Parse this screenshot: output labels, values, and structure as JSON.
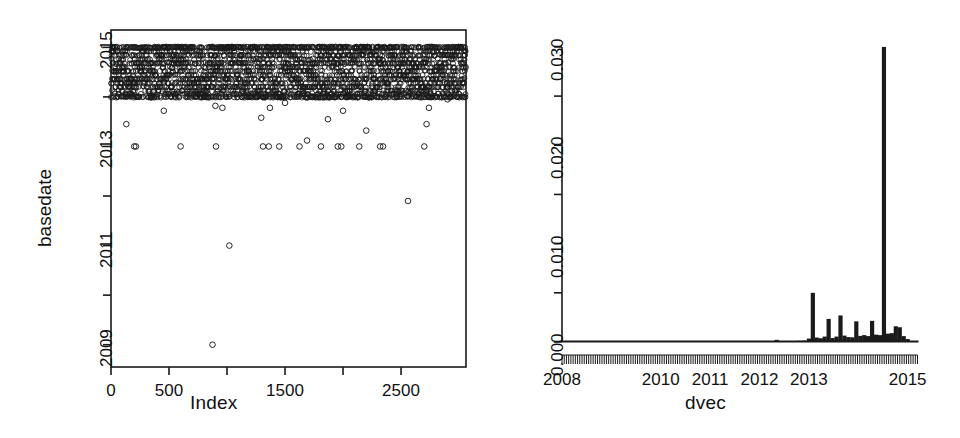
{
  "figure": {
    "background_color": "#ffffff",
    "ink_color": "#1a1a1a",
    "layout": "two-panel-row"
  },
  "chart_data": [
    {
      "id": "left-scatter",
      "type": "scatter",
      "title": "",
      "xlabel": "Index",
      "ylabel": "basedate",
      "xlim": [
        0,
        3060
      ],
      "ylim": [
        2008.55,
        2015.35
      ],
      "grid": false,
      "legend": null,
      "point_marker": "open-circle",
      "xticks": [
        0,
        500,
        1000,
        1500,
        2000,
        2500
      ],
      "xtick_labels": [
        "0",
        "500",
        "",
        "1500",
        "",
        "2500"
      ],
      "yticks": [
        2009,
        2010,
        2011,
        2012,
        2013,
        2014,
        2015
      ],
      "ytick_labels": [
        "2009",
        "",
        "2011",
        "",
        "2013",
        "",
        "2015"
      ],
      "description": "Dense band of points between 2014.0 and 2015.0 across all indices, plus scattered low outliers",
      "dense_band": {
        "y_min": 2014.0,
        "y_max": 2015.05,
        "n_points": 2900
      },
      "outliers": [
        {
          "x": 132,
          "y": 2013.45
        },
        {
          "x": 200,
          "y": 2013.0
        },
        {
          "x": 215,
          "y": 2013.0
        },
        {
          "x": 455,
          "y": 2013.72
        },
        {
          "x": 600,
          "y": 2013.0
        },
        {
          "x": 875,
          "y": 2009.0
        },
        {
          "x": 905,
          "y": 2013.0
        },
        {
          "x": 900,
          "y": 2013.82
        },
        {
          "x": 960,
          "y": 2013.78
        },
        {
          "x": 1020,
          "y": 2011.0
        },
        {
          "x": 1310,
          "y": 2013.0
        },
        {
          "x": 1360,
          "y": 2013.0
        },
        {
          "x": 1295,
          "y": 2013.58
        },
        {
          "x": 1370,
          "y": 2013.78
        },
        {
          "x": 1450,
          "y": 2013.0
        },
        {
          "x": 1500,
          "y": 2013.88
        },
        {
          "x": 1625,
          "y": 2013.0
        },
        {
          "x": 1690,
          "y": 2013.12
        },
        {
          "x": 1810,
          "y": 2013.0
        },
        {
          "x": 1870,
          "y": 2013.55
        },
        {
          "x": 1955,
          "y": 2013.0
        },
        {
          "x": 1985,
          "y": 2013.0
        },
        {
          "x": 2000,
          "y": 2013.72
        },
        {
          "x": 2140,
          "y": 2013.0
        },
        {
          "x": 2200,
          "y": 2013.32
        },
        {
          "x": 2320,
          "y": 2013.0
        },
        {
          "x": 2345,
          "y": 2013.0
        },
        {
          "x": 2560,
          "y": 2011.9
        },
        {
          "x": 2700,
          "y": 2013.0
        },
        {
          "x": 2720,
          "y": 2013.45
        },
        {
          "x": 2740,
          "y": 2013.78
        },
        {
          "x": 2900,
          "y": 2013.95
        }
      ]
    },
    {
      "id": "right-density",
      "type": "bar",
      "title": "",
      "xlabel": "dvec",
      "ylabel": "basedate",
      "xlim": [
        2008.0,
        2015.25
      ],
      "ylim": [
        0.0,
        0.0305
      ],
      "grid": false,
      "legend": null,
      "xticks": [
        2008,
        2009,
        2010,
        2011,
        2012,
        2013,
        2014,
        2015
      ],
      "xtick_labels": [
        "2008",
        "",
        "2010",
        "2011",
        "2012",
        "2013",
        "",
        "2015"
      ],
      "yticks": [
        0.0,
        0.005,
        0.01,
        0.015,
        0.02,
        0.025,
        0.03
      ],
      "ytick_labels": [
        "0.000",
        "",
        "0.010",
        "",
        "0.020",
        "",
        "0.030"
      ],
      "rug": true,
      "rug_note": "dense monthly tick rug below the axis spanning 2008 to 2015",
      "categories": [
        2008.05,
        2008.2,
        2008.4,
        2008.6,
        2008.8,
        2009.0,
        2009.2,
        2009.4,
        2009.6,
        2009.8,
        2010.0,
        2010.2,
        2010.4,
        2010.6,
        2010.8,
        2011.0,
        2011.2,
        2011.4,
        2011.6,
        2011.8,
        2012.0,
        2012.2,
        2012.35,
        2012.5,
        2012.65,
        2012.8,
        2012.9,
        2013.0,
        2013.08,
        2013.16,
        2013.24,
        2013.32,
        2013.4,
        2013.48,
        2013.56,
        2013.64,
        2013.72,
        2013.8,
        2013.88,
        2013.96,
        2014.04,
        2014.12,
        2014.2,
        2014.28,
        2014.36,
        2014.44,
        2014.52,
        2014.6,
        2014.68,
        2014.76,
        2014.84,
        2014.92,
        2015.0,
        2015.08,
        2015.16
      ],
      "values": [
        4e-05,
        4e-05,
        4e-05,
        4e-05,
        4e-05,
        4e-05,
        4e-05,
        4e-05,
        4e-05,
        4e-05,
        4e-05,
        4e-05,
        4e-05,
        4e-05,
        4e-05,
        4e-05,
        4e-05,
        4e-05,
        4e-05,
        4e-05,
        4e-05,
        4e-05,
        0.00022,
        6e-05,
        6e-05,
        0.00012,
        0.00014,
        0.00035,
        0.005,
        0.00045,
        0.00038,
        0.00055,
        0.00235,
        0.0004,
        0.00055,
        0.0027,
        0.00065,
        0.0005,
        0.00048,
        0.0021,
        0.00062,
        0.0007,
        0.0006,
        0.00215,
        0.00075,
        0.0007,
        0.03,
        0.00085,
        0.0009,
        0.0016,
        0.0015,
        0.0006,
        0.0003,
        0.0001,
        5e-05
      ]
    }
  ],
  "left_panel": {
    "ylabel": "basedate",
    "xlabel": "Index",
    "ytick_labels": [
      "2015",
      "2013",
      "2011",
      "2009"
    ],
    "xtick_labels": [
      "0",
      "500",
      "1500",
      "2500"
    ]
  },
  "right_panel": {
    "ylabel": "basedate",
    "xlabel": "dvec",
    "ytick_labels": [
      "0.030",
      "0.020",
      "0.010",
      "0.000"
    ],
    "xtick_labels": [
      "2008",
      "2010",
      "2011",
      "2012",
      "2013",
      "2015"
    ]
  }
}
